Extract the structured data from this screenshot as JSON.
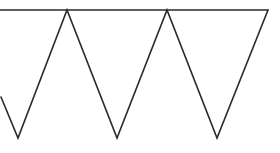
{
  "diagram": {
    "stroke_color": "#2a2a2a",
    "background": "#ffffff",
    "stroke_width": 1.6,
    "top_line": {
      "x1": 0,
      "y1": 10,
      "x2": 268,
      "y2": 10
    },
    "zigzag_points": "1,97 18,138 67,10 117,138 167,10 217,138 268,10",
    "peaks": [
      {
        "x": 67,
        "y": 10
      },
      {
        "x": 167,
        "y": 10
      },
      {
        "x": 268,
        "y": 10
      }
    ],
    "valleys": [
      {
        "x": 18,
        "y": 138
      },
      {
        "x": 117,
        "y": 138
      },
      {
        "x": 217,
        "y": 138
      }
    ]
  }
}
